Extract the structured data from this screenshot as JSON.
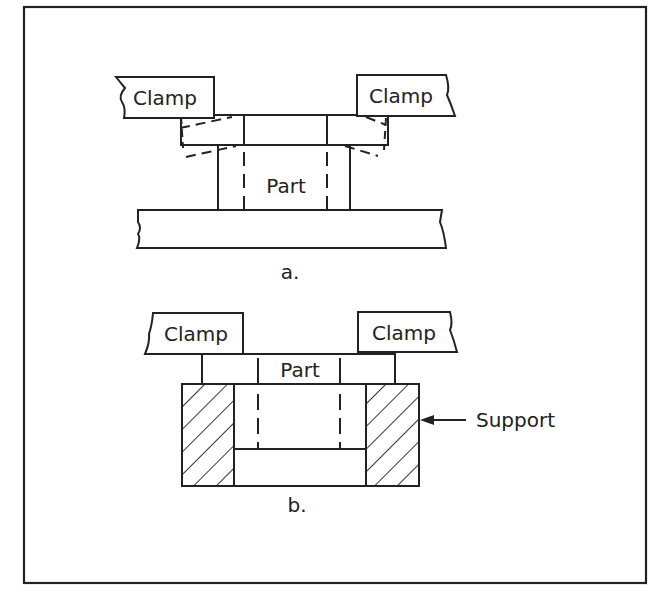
{
  "figure": {
    "panel_a": {
      "caption": "a.",
      "clamp_left_label": "Clamp",
      "clamp_right_label": "Clamp",
      "part_label": "Part"
    },
    "panel_b": {
      "caption": "b.",
      "clamp_left_label": "Clamp",
      "clamp_right_label": "Clamp",
      "part_label": "Part",
      "support_label": "Support"
    },
    "colors": {
      "line": "#222222",
      "background": "#ffffff"
    }
  }
}
